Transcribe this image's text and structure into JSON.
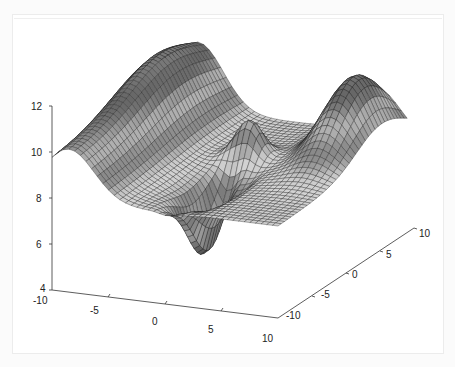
{
  "chart_data": {
    "type": "surface3d",
    "title": "",
    "xlabel": "",
    "ylabel": "",
    "zlabel": "",
    "xlim": [
      -10,
      10
    ],
    "ylim": [
      -10,
      10
    ],
    "zlim": [
      4,
      12
    ],
    "x_ticks": [
      "-10",
      "-5",
      "0",
      "5",
      "10"
    ],
    "y_ticks": [
      "-10",
      "-5",
      "0",
      "5",
      "10"
    ],
    "z_ticks": [
      "4",
      "6",
      "8",
      "10",
      "12"
    ],
    "colormap": "gray",
    "grid_resolution": 41,
    "features": [
      {
        "name": "left-ridge",
        "peak_z": 12
      },
      {
        "name": "right-hump",
        "peak_z": 11.3
      },
      {
        "name": "center-peak",
        "peak_z": 9.6
      },
      {
        "name": "central-valley-min",
        "min_z": 5.5
      }
    ]
  },
  "axes": {
    "z": {
      "labels": [
        "12",
        "10",
        "8",
        "6",
        "4"
      ]
    },
    "x": {
      "labels": [
        "-10",
        "-5",
        "0",
        "5",
        "10"
      ]
    },
    "y": {
      "labels": [
        "-10",
        "-5",
        "0",
        "5",
        "10"
      ]
    }
  },
  "colors": {
    "background": "#ffffff",
    "axis": "#333333",
    "mesh_edge": "#1a1a1a"
  }
}
